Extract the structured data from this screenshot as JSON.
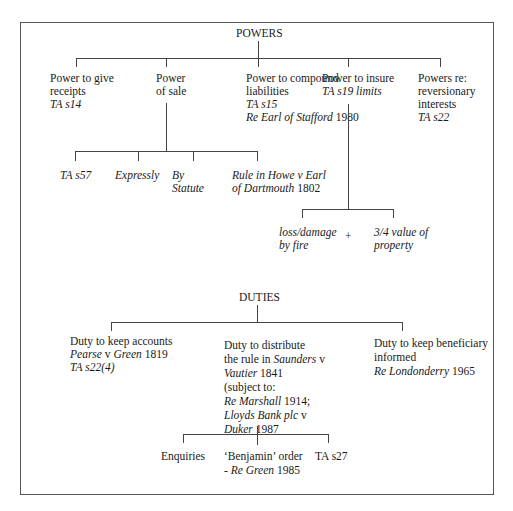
{
  "powers": {
    "title": "POWERS",
    "receipts": {
      "l1": "Power to give",
      "l2": "receipts",
      "ref": "TA s14"
    },
    "sale": {
      "l1": "Power",
      "l2": "of sale",
      "children": {
        "ta57": "TA s57",
        "expressly": "Expressly",
        "statute_l1": "By",
        "statute_l2": "Statute",
        "howe_l1": "Rule in Howe  v Earl",
        "howe_l2_it": "of Dartmouth",
        "howe_l2_year": " 1802"
      }
    },
    "compound": {
      "l1": "Power to compound",
      "l2": "liabilities",
      "ref": "TA s15",
      "case_it": "Re Earl of Stafford",
      "case_year": " 1980"
    },
    "insure": {
      "l1": "Power to insure",
      "ref": "TA s19 limits",
      "children": {
        "fire_l1": "loss/damage",
        "fire_l2": "by fire",
        "plus": "+",
        "value_l1": "3/4 value of",
        "value_l2": "property"
      }
    },
    "reversionary": {
      "l1": "Powers re:",
      "l2": "reversionary",
      "l3": "interests",
      "ref": "TA s22"
    }
  },
  "duties": {
    "title": "DUTIES",
    "accounts": {
      "l1": "Duty to keep accounts",
      "case_it": "Pearse",
      "case_v": " v ",
      "case_it2": "Green",
      "case_year": " 1819",
      "ref": "TA s22(4)"
    },
    "distribute": {
      "l1": "Duty to distribute",
      "l2_pre": "the rule in ",
      "l2_it": "Saunders",
      "l2_post": " v",
      "l3_it": "Vautier",
      "l3_year": " 1841",
      "l4": "(subject to:",
      "l5_it": "Re Marshall",
      "l5_year": " 1914;",
      "l6_it": "Lloyds Bank plc",
      "l6_post": " v",
      "l7_it": "Duker",
      "l7_year": " 1987",
      "children": {
        "enquiries": "Enquiries",
        "benjamin_l1": "‘Benjamin’ order",
        "benjamin_l2_pre": "- ",
        "benjamin_l2_it": "Re Green",
        "benjamin_l2_year": " 1985",
        "ta27": "TA s27"
      }
    },
    "informed": {
      "l1": "Duty to keep beneficiary",
      "l2": "informed",
      "case_it": "Re Londonderry",
      "case_year": " 1965"
    }
  }
}
